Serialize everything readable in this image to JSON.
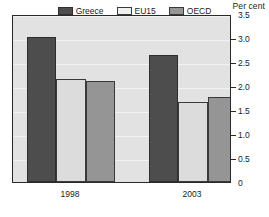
{
  "chart_data": {
    "type": "bar",
    "title": "",
    "subtitle": "",
    "unit_label": "Per cent",
    "xlabel": "",
    "ylabel": "",
    "categories": [
      "1998",
      "2003"
    ],
    "series": [
      {
        "name": "Greece",
        "values": [
          3.02,
          2.64
        ],
        "color": "#4d4d4d"
      },
      {
        "name": "EU15",
        "values": [
          2.15,
          1.66
        ],
        "color": "#dcdcdc"
      },
      {
        "name": "OECD",
        "values": [
          2.1,
          1.77
        ],
        "color": "#959595"
      }
    ],
    "ylim": [
      0,
      3.5
    ],
    "yticks": [
      0,
      0.5,
      1.0,
      1.5,
      2.0,
      2.5,
      3.0,
      3.5
    ],
    "ytick_labels": [
      "0",
      "0.5",
      "1.0",
      "1.5",
      "2.0",
      "2.5",
      "3.0",
      "3.5"
    ],
    "grid": true,
    "legend_position": "top-center",
    "plot_background": "#e2e2e2",
    "frame_color": "#2a2a2a"
  }
}
